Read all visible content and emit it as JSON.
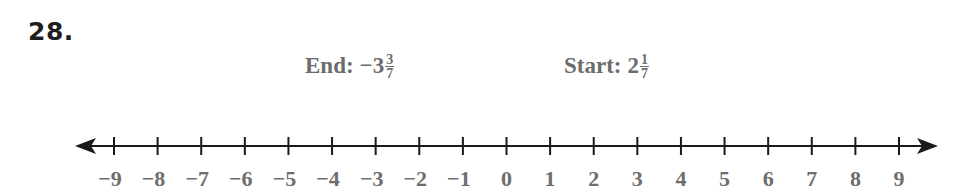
{
  "problem": {
    "number": "28."
  },
  "labels": {
    "end": {
      "prefix": "End:",
      "sign": "−",
      "whole": "3",
      "numerator": "3",
      "denominator": "7",
      "value": -3.4286
    },
    "start": {
      "prefix": "Start:",
      "sign": "",
      "whole": "2",
      "numerator": "1",
      "denominator": "7",
      "value": 2.1429
    }
  },
  "number_line": {
    "min": -9,
    "max": 9,
    "step": 1,
    "arrows": "both",
    "ticks": [
      "−9",
      "−8",
      "−7",
      "−6",
      "−5",
      "−4",
      "−3",
      "−2",
      "−1",
      "0",
      "1",
      "2",
      "3",
      "4",
      "5",
      "6",
      "7",
      "8",
      "9"
    ]
  },
  "colors": {
    "line": "#1a1a1a",
    "label_text": "#6c6c6c",
    "number_text": "#1e1e1e"
  }
}
